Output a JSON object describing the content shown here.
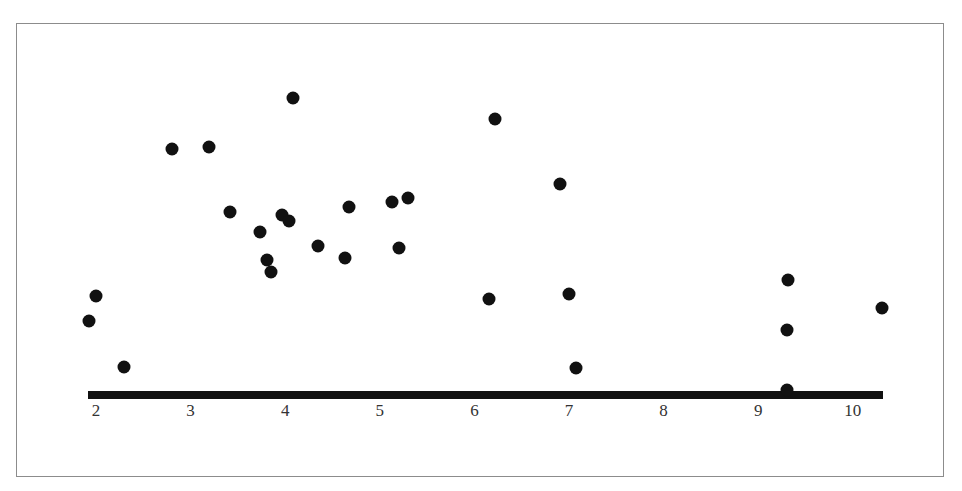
{
  "chart_data": {
    "type": "scatter",
    "title": "",
    "xlabel": "",
    "ylabel": "",
    "x_ticks": [
      2,
      3,
      4,
      5,
      6,
      7,
      8,
      9,
      10
    ],
    "xlim": [
      1.9,
      10.3
    ],
    "y_axis_shown": false,
    "y_units": "relative height above axis (pixels, no scale shown)",
    "ylim": [
      0,
      300
    ],
    "grid": false,
    "legend": null,
    "points": [
      {
        "x": 1.93,
        "y": 74
      },
      {
        "x": 2.0,
        "y": 99
      },
      {
        "x": 2.3,
        "y": 28
      },
      {
        "x": 2.8,
        "y": 246
      },
      {
        "x": 3.19,
        "y": 248
      },
      {
        "x": 3.42,
        "y": 183
      },
      {
        "x": 3.73,
        "y": 163
      },
      {
        "x": 3.81,
        "y": 135
      },
      {
        "x": 3.85,
        "y": 123
      },
      {
        "x": 3.97,
        "y": 180
      },
      {
        "x": 4.04,
        "y": 174
      },
      {
        "x": 4.08,
        "y": 297
      },
      {
        "x": 4.35,
        "y": 149
      },
      {
        "x": 4.63,
        "y": 137
      },
      {
        "x": 4.67,
        "y": 188
      },
      {
        "x": 5.13,
        "y": 193
      },
      {
        "x": 5.2,
        "y": 147
      },
      {
        "x": 5.3,
        "y": 197
      },
      {
        "x": 6.15,
        "y": 96
      },
      {
        "x": 6.22,
        "y": 276
      },
      {
        "x": 6.9,
        "y": 211
      },
      {
        "x": 7.0,
        "y": 101
      },
      {
        "x": 7.07,
        "y": 27
      },
      {
        "x": 9.3,
        "y": 5
      },
      {
        "x": 9.3,
        "y": 65
      },
      {
        "x": 9.31,
        "y": 115
      },
      {
        "x": 10.31,
        "y": 87
      }
    ],
    "pixel_map": {
      "x_origin_px": 96,
      "x_origin_val": 2,
      "px_per_unit_x": 94.6,
      "axis_y_px": 395
    }
  },
  "axis": {
    "tick_labels": [
      "2",
      "3",
      "4",
      "5",
      "6",
      "7",
      "8",
      "9",
      "10"
    ]
  }
}
